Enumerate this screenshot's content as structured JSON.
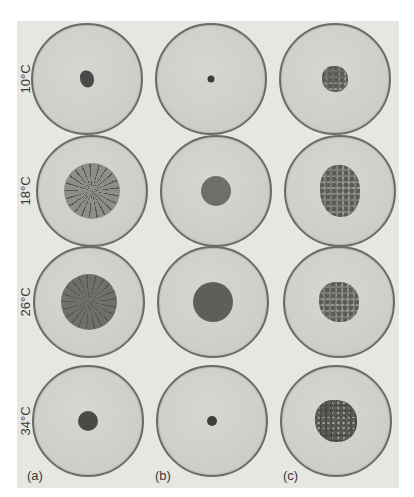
{
  "figure": {
    "row_labels": [
      "10°C",
      "18°C",
      "26°C",
      "34°C"
    ],
    "column_labels": [
      "(a)",
      "(b)",
      "(c)"
    ],
    "plates": [
      {
        "row": 0,
        "col": 0,
        "cx": 87,
        "cy": 79,
        "r": 51,
        "colony": {
          "size": 14,
          "color": "#4a4a48",
          "shape": "irregular"
        }
      },
      {
        "row": 0,
        "col": 1,
        "cx": 211,
        "cy": 79,
        "r": 51,
        "colony": {
          "size": 7,
          "color": "#3c3c3a",
          "shape": "dot"
        }
      },
      {
        "row": 0,
        "col": 2,
        "cx": 335,
        "cy": 79,
        "r": 51,
        "colony": {
          "size": 26,
          "color": "#6a6a66",
          "shape": "fuzzy"
        }
      },
      {
        "row": 1,
        "col": 0,
        "cx": 92,
        "cy": 191,
        "r": 51,
        "colony": {
          "size": 54,
          "color": "#8d8d89",
          "shape": "radial"
        }
      },
      {
        "row": 1,
        "col": 1,
        "cx": 216,
        "cy": 191,
        "r": 51,
        "colony": {
          "size": 30,
          "color": "#6e6e6b",
          "shape": "round"
        }
      },
      {
        "row": 1,
        "col": 2,
        "cx": 340,
        "cy": 191,
        "r": 51,
        "colony": {
          "size": 40,
          "color": "#7b7b77",
          "shape": "fuzzy"
        }
      },
      {
        "row": 2,
        "col": 0,
        "cx": 89,
        "cy": 302,
        "r": 51,
        "colony": {
          "size": 54,
          "color": "#6f6f6c",
          "shape": "radial"
        }
      },
      {
        "row": 2,
        "col": 1,
        "cx": 213,
        "cy": 302,
        "r": 51,
        "colony": {
          "size": 40,
          "color": "#5e5e5b",
          "shape": "round"
        }
      },
      {
        "row": 2,
        "col": 2,
        "cx": 339,
        "cy": 302,
        "r": 51,
        "colony": {
          "size": 40,
          "color": "#7a7a76",
          "shape": "fuzzy"
        }
      },
      {
        "row": 3,
        "col": 0,
        "cx": 88,
        "cy": 421,
        "r": 51,
        "colony": {
          "size": 20,
          "color": "#4a4a47",
          "shape": "round"
        }
      },
      {
        "row": 3,
        "col": 1,
        "cx": 212,
        "cy": 421,
        "r": 51,
        "colony": {
          "size": 10,
          "color": "#3e3e3c",
          "shape": "dot"
        }
      },
      {
        "row": 3,
        "col": 2,
        "cx": 336,
        "cy": 421,
        "r": 51,
        "colony": {
          "size": 42,
          "color": "#474744",
          "shape": "fuzzy"
        }
      }
    ]
  }
}
